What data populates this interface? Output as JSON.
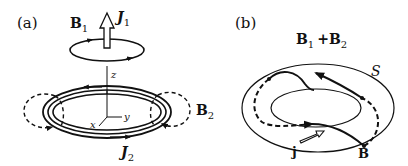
{
  "panel_a": {
    "label": "(a)",
    "b1_label": "B",
    "b1_sub": "1",
    "j1_label": "J",
    "j1_sub": "1",
    "axis_z": "z",
    "axis_x": "x",
    "axis_y": "y",
    "b2_label": "B",
    "b2_sub": "2",
    "j2_label": "J",
    "j2_sub": "2"
  },
  "panel_b": {
    "label": "(b)",
    "title_b1": "B",
    "title_sub1": "1",
    "title_plus": "+",
    "title_b2": "B",
    "title_sub2": "2",
    "surface_label": "S",
    "current_label": "j",
    "field_label": "B"
  },
  "colors": {
    "stroke": "#111111",
    "background": "#ffffff"
  }
}
